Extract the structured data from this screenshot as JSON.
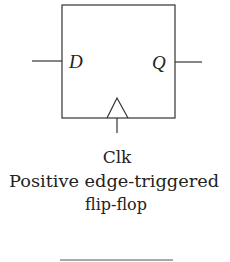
{
  "diagram": {
    "type": "flip-flop-symbol",
    "inputs": {
      "d_label": "D"
    },
    "outputs": {
      "q_label": "Q"
    },
    "clock": {
      "label": "Clk",
      "edge_indicator": "triangle-icon"
    },
    "caption": {
      "line1": "Positive edge-triggered",
      "line2": "flip-flop"
    },
    "colors": {
      "stroke": "#333333",
      "text": "#222222",
      "background": "#ffffff"
    }
  }
}
